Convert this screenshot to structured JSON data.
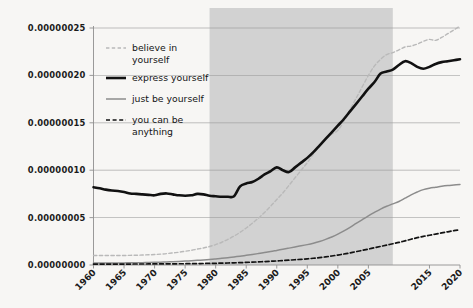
{
  "chart_data": {
    "type": "line",
    "title": "",
    "xlabel": "",
    "ylabel": "",
    "xlim": [
      1960,
      2020
    ],
    "ylim": [
      0.0,
      2.5e-07
    ],
    "grid": true,
    "grid_axis": "y",
    "legend_position": "upper-left-inside",
    "background_color": "#f7f6f4",
    "x_tick_labels": [
      "1960",
      "1965",
      "1970",
      "1975",
      "1980",
      "1985",
      "1990",
      "1995",
      "2000",
      "2005",
      "2015",
      "2020"
    ],
    "x_tick_values": [
      1960,
      1965,
      1970,
      1975,
      1980,
      1985,
      1990,
      1995,
      2000,
      2005,
      2015,
      2020
    ],
    "x_tick_rotation_deg": 45,
    "y_tick_labels": [
      "0.00000000",
      "0.00000005",
      "0.00000010",
      "0.00000015",
      "0.00000020",
      "0.00000025"
    ],
    "y_tick_values": [
      0.0,
      5e-08,
      1e-07,
      1.5e-07,
      2e-07,
      2.5e-07
    ],
    "shaded_span": {
      "label": "",
      "x_start": 1979,
      "x_end": 2009,
      "color": "#d2d2d2",
      "opacity": 1
    },
    "x": [
      1960,
      1961,
      1962,
      1963,
      1964,
      1965,
      1966,
      1967,
      1968,
      1969,
      1970,
      1971,
      1972,
      1973,
      1974,
      1975,
      1976,
      1977,
      1978,
      1979,
      1980,
      1981,
      1982,
      1983,
      1984,
      1985,
      1986,
      1987,
      1988,
      1989,
      1990,
      1991,
      1992,
      1993,
      1994,
      1995,
      1996,
      1997,
      1998,
      1999,
      2000,
      2001,
      2002,
      2003,
      2004,
      2005,
      2006,
      2007,
      2008,
      2009,
      2010,
      2011,
      2012,
      2013,
      2014,
      2015,
      2016,
      2017,
      2018,
      2019,
      2020
    ],
    "series": [
      {
        "name": "believe in yourself",
        "color": "#b9b9b9",
        "style": "dashed",
        "width": 1.4,
        "values": [
          1e-08,
          1e-08,
          1e-08,
          1e-08,
          1e-08,
          1e-08,
          1.02e-08,
          1.03e-08,
          1.05e-08,
          1.08e-08,
          1.1e-08,
          1.15e-08,
          1.2e-08,
          1.28e-08,
          1.35e-08,
          1.45e-08,
          1.55e-08,
          1.68e-08,
          1.8e-08,
          1.95e-08,
          2.15e-08,
          2.4e-08,
          2.7e-08,
          3.05e-08,
          3.45e-08,
          3.9e-08,
          4.4e-08,
          4.95e-08,
          5.55e-08,
          6.2e-08,
          6.9e-08,
          7.6e-08,
          8.4e-08,
          9.2e-08,
          1e-07,
          1.08e-07,
          1.17e-07,
          1.26e-07,
          1.33e-07,
          1.38e-07,
          1.42e-07,
          1.52e-07,
          1.64e-07,
          1.76e-07,
          1.88e-07,
          2e-07,
          2.1e-07,
          2.17e-07,
          2.22e-07,
          2.24e-07,
          2.27e-07,
          2.3e-07,
          2.31e-07,
          2.33e-07,
          2.36e-07,
          2.38e-07,
          2.37e-07,
          2.4e-07,
          2.44e-07,
          2.48e-07,
          2.52e-07
        ]
      },
      {
        "name": "express yourself",
        "color": "#111111",
        "style": "solid",
        "width": 2.6,
        "values": [
          8.2e-08,
          8.1e-08,
          7.95e-08,
          7.85e-08,
          7.8e-08,
          7.7e-08,
          7.55e-08,
          7.5e-08,
          7.45e-08,
          7.4e-08,
          7.35e-08,
          7.5e-08,
          7.55e-08,
          7.45e-08,
          7.35e-08,
          7.3e-08,
          7.35e-08,
          7.5e-08,
          7.45e-08,
          7.3e-08,
          7.25e-08,
          7.2e-08,
          7.2e-08,
          7.25e-08,
          8.3e-08,
          8.6e-08,
          8.75e-08,
          9.1e-08,
          9.55e-08,
          9.9e-08,
          1.03e-07,
          1e-07,
          9.8e-08,
          1.03e-07,
          1.08e-07,
          1.13e-07,
          1.19e-07,
          1.26e-07,
          1.33e-07,
          1.4e-07,
          1.47e-07,
          1.54e-07,
          1.62e-07,
          1.7e-07,
          1.78e-07,
          1.86e-07,
          1.93e-07,
          2.02e-07,
          2.04e-07,
          2.06e-07,
          2.11e-07,
          2.15e-07,
          2.13e-07,
          2.09e-07,
          2.07e-07,
          2.09e-07,
          2.12e-07,
          2.14e-07,
          2.15e-07,
          2.16e-07,
          2.17e-07
        ]
      },
      {
        "name": "just be yourself",
        "color": "#8c8c8c",
        "style": "solid",
        "width": 1.5,
        "values": [
          2e-09,
          2e-09,
          2e-09,
          2.1e-09,
          2.1e-09,
          2.2e-09,
          2.3e-09,
          2.4e-09,
          2.5e-09,
          2.6e-09,
          2.8e-09,
          3e-09,
          3.2e-09,
          3.5e-09,
          3.8e-09,
          4.1e-09,
          4.5e-09,
          4.9e-09,
          5.3e-09,
          5.8e-09,
          6.4e-09,
          7e-09,
          7.7e-09,
          8.5e-09,
          9.3e-09,
          1.02e-08,
          1.11e-08,
          1.21e-08,
          1.31e-08,
          1.42e-08,
          1.54e-08,
          1.66e-08,
          1.78e-08,
          1.9e-08,
          2.02e-08,
          2.15e-08,
          2.3e-08,
          2.48e-08,
          2.7e-08,
          2.95e-08,
          3.25e-08,
          3.6e-08,
          3.98e-08,
          4.38e-08,
          4.78e-08,
          5.18e-08,
          5.55e-08,
          5.9e-08,
          6.2e-08,
          6.45e-08,
          6.7e-08,
          7.05e-08,
          7.4e-08,
          7.7e-08,
          7.95e-08,
          8.1e-08,
          8.2e-08,
          8.3e-08,
          8.38e-08,
          8.44e-08,
          8.5e-08
        ]
      },
      {
        "name": "you can be anything",
        "color": "#121212",
        "style": "dashed",
        "width": 1.7,
        "values": [
          1e-09,
          1e-09,
          1e-09,
          1e-09,
          1e-09,
          1e-09,
          1e-09,
          1.05e-09,
          1.05e-09,
          1.1e-09,
          1.1e-09,
          1.15e-09,
          1.2e-09,
          1.25e-09,
          1.3e-09,
          1.35e-09,
          1.4e-09,
          1.5e-09,
          1.6e-09,
          1.7e-09,
          1.8e-09,
          1.95e-09,
          2.1e-09,
          2.3e-09,
          2.5e-09,
          2.75e-09,
          3e-09,
          3.3e-09,
          3.6e-09,
          3.95e-09,
          4.3e-09,
          4.7e-09,
          5.1e-09,
          5.55e-09,
          6e-09,
          6.5e-09,
          7.1e-09,
          7.8e-09,
          8.6e-09,
          9.5e-09,
          1.05e-08,
          1.16e-08,
          1.28e-08,
          1.41e-08,
          1.54e-08,
          1.68e-08,
          1.82e-08,
          1.96e-08,
          2.1e-08,
          2.24e-08,
          2.38e-08,
          2.55e-08,
          2.72e-08,
          2.88e-08,
          3.02e-08,
          3.14e-08,
          3.26e-08,
          3.38e-08,
          3.5e-08,
          3.62e-08,
          3.72e-08
        ]
      }
    ]
  },
  "legend": {
    "entries": [
      {
        "label_line1": "believe in",
        "label_line2": "yourself"
      },
      {
        "label_line1": "express yourself",
        "label_line2": ""
      },
      {
        "label_line1": "just be yourself",
        "label_line2": ""
      },
      {
        "label_line1": "you can be",
        "label_line2": "anything"
      }
    ]
  }
}
